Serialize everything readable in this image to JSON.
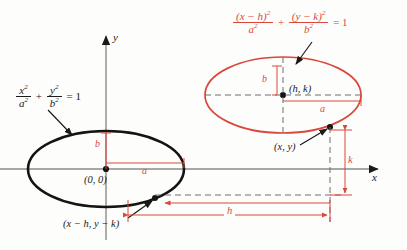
{
  "figure": {
    "colors": {
      "red": "#d9483b",
      "black": "#1a1a1a",
      "gray": "#8a8a8a"
    }
  },
  "axes": {
    "x_label": "x",
    "y_label": "y"
  },
  "equations": {
    "standard": {
      "frac1_num": "x",
      "frac1_num_exp": "2",
      "frac1_den": "a",
      "frac1_den_exp": "2",
      "plus": "+",
      "frac2_num": "y",
      "frac2_num_exp": "2",
      "frac2_den": "b",
      "frac2_den_exp": "2",
      "equals": "= 1"
    },
    "translated": {
      "frac1_num": "(x − h)",
      "frac1_num_exp": "2",
      "frac1_den": "a",
      "frac1_den_exp": "2",
      "plus": "+",
      "frac2_num": "(y − k)",
      "frac2_num_exp": "2",
      "frac2_den": "b",
      "frac2_den_exp": "2",
      "equals": "= 1"
    }
  },
  "labels": {
    "origin_center": "(0, 0)",
    "translated_center": "(h, k)",
    "point_on_translated": "(x, y)",
    "point_on_standard": "(x − h, y − k)",
    "semi_minor_black": "b",
    "semi_major_black": "a",
    "semi_minor_red": "b",
    "semi_major_red": "a",
    "shift_horizontal": "h",
    "shift_vertical": "k"
  }
}
